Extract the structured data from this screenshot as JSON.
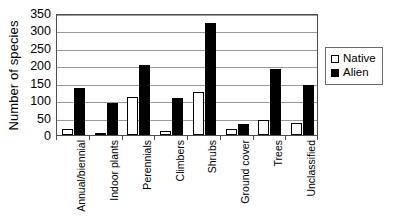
{
  "chart_data": {
    "type": "bar",
    "title": "",
    "subtitle": "",
    "xlabel": "",
    "ylabel": "Number of species",
    "ylim": [
      0,
      350
    ],
    "yticks": [
      0,
      50,
      100,
      150,
      200,
      250,
      300,
      350
    ],
    "ytick_labels": [
      "0",
      "50",
      "100",
      "150",
      "200",
      "250",
      "300",
      "350"
    ],
    "grid": true,
    "grid_axis": "y",
    "legend_position": "right",
    "categories": [
      "Annual/biennial",
      "Indoor plants",
      "Perennials",
      "Climbers",
      "Shrubs",
      "Ground cover",
      "Trees",
      "Unclassified"
    ],
    "series": [
      {
        "name": "Native",
        "color": "#ffffff",
        "edge_color": "#000000",
        "values": [
          18,
          3,
          108,
          12,
          123,
          18,
          43,
          34
        ]
      },
      {
        "name": "Alien",
        "color": "#000000",
        "edge_color": "#000000",
        "values": [
          135,
          92,
          200,
          105,
          320,
          31,
          190,
          143
        ]
      }
    ]
  },
  "legend": {
    "entries": [
      {
        "label": "Native",
        "swatch": "hollow-square"
      },
      {
        "label": "Alien",
        "swatch": "filled-square"
      }
    ]
  }
}
